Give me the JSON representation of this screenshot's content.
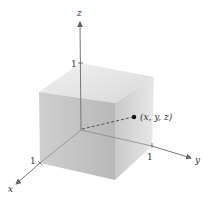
{
  "figure": {
    "type": "3d-coordinate-cube",
    "axes": {
      "x": {
        "label": "x",
        "tick_label": "1"
      },
      "y": {
        "label": "y",
        "tick_label": "1"
      },
      "z": {
        "label": "z",
        "tick_label": "1"
      }
    },
    "point": {
      "label": "(x, y, z)"
    },
    "colors": {
      "axis": "#777777",
      "cube_top": "#e6e6e6",
      "cube_left": "#c4c4c4",
      "cube_right": "#d4d4d4",
      "point": "#111111"
    }
  }
}
